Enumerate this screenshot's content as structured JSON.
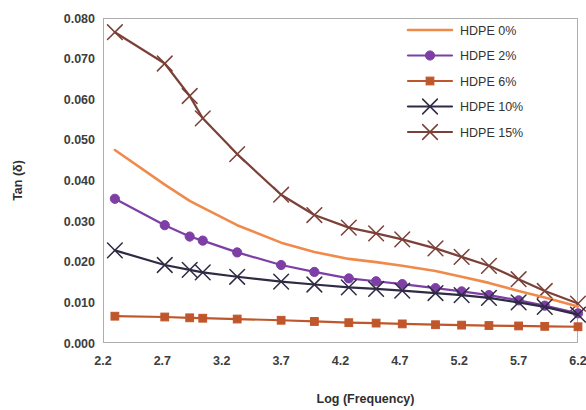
{
  "chart_data": {
    "type": "line",
    "title": "",
    "xlabel": "Log (Frequency)",
    "ylabel": "Tan (δ)",
    "xlim": [
      2.2,
      6.2
    ],
    "ylim": [
      0.0,
      0.08
    ],
    "xticks": [
      "2.2",
      "2.7",
      "3.2",
      "3.7",
      "4.2",
      "4.7",
      "5.2",
      "5.7",
      "6.2"
    ],
    "xtick_values": [
      2.2,
      2.7,
      3.2,
      3.7,
      4.2,
      4.7,
      5.2,
      5.7,
      6.2
    ],
    "yticks": [
      "0.000",
      "0.010",
      "0.020",
      "0.030",
      "0.040",
      "0.050",
      "0.060",
      "0.070",
      "0.080"
    ],
    "ytick_values": [
      0.0,
      0.01,
      0.02,
      0.03,
      0.04,
      0.05,
      0.06,
      0.07,
      0.08
    ],
    "grid": false,
    "legend_position": "top-right",
    "series": [
      {
        "name": "HDPE 0%",
        "color": "#F08a4b",
        "marker": "none",
        "x": [
          2.3,
          2.72,
          2.93,
          3.04,
          3.33,
          3.7,
          3.98,
          4.27,
          4.5,
          4.72,
          5.0,
          5.22,
          5.45,
          5.7,
          5.92,
          6.2
        ],
        "values": [
          0.0475,
          0.039,
          0.035,
          0.0333,
          0.029,
          0.0247,
          0.0224,
          0.0207,
          0.0199,
          0.019,
          0.0177,
          0.0163,
          0.0148,
          0.0128,
          0.0112,
          0.009
        ]
      },
      {
        "name": "HDPE 2%",
        "color": "#7D3FA5",
        "marker": "circle",
        "x": [
          2.3,
          2.72,
          2.93,
          3.04,
          3.33,
          3.7,
          3.98,
          4.27,
          4.5,
          4.72,
          5.0,
          5.22,
          5.45,
          5.7,
          5.92,
          6.2
        ],
        "values": [
          0.0355,
          0.029,
          0.0262,
          0.0252,
          0.0223,
          0.0192,
          0.0175,
          0.0159,
          0.0152,
          0.0145,
          0.0135,
          0.0127,
          0.0118,
          0.0105,
          0.0092,
          0.0073
        ]
      },
      {
        "name": "HDPE 6%",
        "color": "#C0562B",
        "marker": "square",
        "x": [
          2.3,
          2.72,
          2.93,
          3.04,
          3.33,
          3.7,
          3.98,
          4.27,
          4.5,
          4.72,
          5.0,
          5.22,
          5.45,
          5.7,
          5.92,
          6.2
        ],
        "values": [
          0.0066,
          0.0064,
          0.0062,
          0.0061,
          0.0059,
          0.0056,
          0.0053,
          0.005,
          0.0049,
          0.0047,
          0.0045,
          0.0044,
          0.0043,
          0.0042,
          0.0041,
          0.004
        ]
      },
      {
        "name": "HDPE 10%",
        "color": "#2F2B45",
        "marker": "x",
        "x": [
          2.3,
          2.72,
          2.93,
          3.04,
          3.33,
          3.7,
          3.98,
          4.27,
          4.5,
          4.72,
          5.0,
          5.22,
          5.45,
          5.7,
          5.92,
          6.2
        ],
        "values": [
          0.0228,
          0.0192,
          0.018,
          0.0174,
          0.0163,
          0.0151,
          0.0144,
          0.0137,
          0.0133,
          0.0129,
          0.0123,
          0.0118,
          0.0111,
          0.01,
          0.0089,
          0.007
        ]
      },
      {
        "name": "HDPE 15%",
        "color": "#7B4138",
        "marker": "x",
        "x": [
          2.3,
          2.72,
          2.93,
          3.04,
          3.33,
          3.7,
          3.98,
          4.27,
          4.5,
          4.72,
          5.0,
          5.22,
          5.45,
          5.7,
          5.92,
          6.2
        ],
        "values": [
          0.0765,
          0.0688,
          0.0608,
          0.0553,
          0.0465,
          0.0365,
          0.0315,
          0.0284,
          0.027,
          0.0255,
          0.0233,
          0.0212,
          0.019,
          0.0157,
          0.0128,
          0.0097
        ]
      }
    ]
  },
  "legend": {
    "items": [
      {
        "label": "HDPE 0%"
      },
      {
        "label": "HDPE 2%"
      },
      {
        "label": "HDPE 6%"
      },
      {
        "label": "HDPE 10%"
      },
      {
        "label": "HDPE 15%"
      }
    ]
  }
}
